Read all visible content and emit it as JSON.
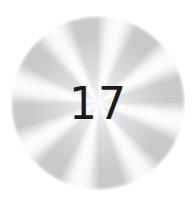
{
  "badge": {
    "number": "17",
    "colors": {
      "ray": "#c9c9c9",
      "gap": "#fbfbfb",
      "text": "#1b1b1b",
      "background": "#ffffff"
    },
    "rays": 8
  }
}
